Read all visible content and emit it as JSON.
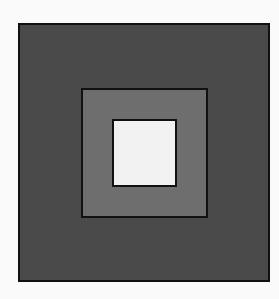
{
  "diagram": {
    "type": "nested-squares",
    "background": "#fafafa",
    "border_color": "#111111",
    "squares": [
      {
        "name": "outer",
        "fill": "#4a4a4a"
      },
      {
        "name": "middle",
        "fill": "#6e6e6e"
      },
      {
        "name": "inner",
        "fill": "#f2f2f2"
      }
    ]
  }
}
